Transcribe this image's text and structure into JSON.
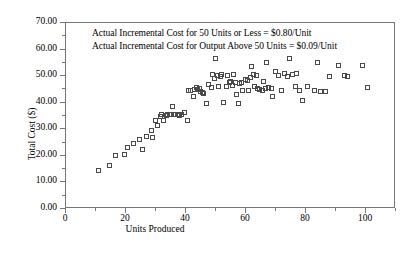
{
  "chart_data": {
    "type": "scatter",
    "title": "",
    "xlabel": "Units Produced",
    "ylabel": "Total Cost ($)",
    "xlim": [
      0,
      110
    ],
    "ylim": [
      0,
      70
    ],
    "grid": false,
    "legend": null,
    "marker": "open-square",
    "marker_color": "#4a4a4a",
    "xticks": [
      0,
      20,
      40,
      60,
      80,
      100
    ],
    "xtick_labels": [
      "0",
      "20",
      "40",
      "60",
      "80",
      "100"
    ],
    "xticks_minor": [
      10,
      30,
      50,
      70,
      90,
      110
    ],
    "yticks": [
      0,
      10,
      20,
      30,
      40,
      50,
      60,
      70
    ],
    "ytick_labels": [
      "0.00",
      "10.00",
      "20.00",
      "30.00",
      "40.00",
      "50.00",
      "60.00",
      "70.00"
    ],
    "yticks_minor": [
      5,
      15,
      25,
      35,
      45,
      55,
      65
    ],
    "annotations": [
      "Actual Incremental Cost for 50 Units or Less = $0.80/Unit",
      "Actual Incremental Cost for Output Above 50 Units = $0.09/Unit"
    ],
    "series": [
      {
        "name": "Total Cost observations",
        "points": [
          [
            11.0,
            14.2
          ],
          [
            14.5,
            16.3
          ],
          [
            16.5,
            20.0
          ],
          [
            19.5,
            20.2
          ],
          [
            20.5,
            22.8
          ],
          [
            22.5,
            24.5
          ],
          [
            24.5,
            25.8
          ],
          [
            25.5,
            22.3
          ],
          [
            27.0,
            27.0
          ],
          [
            28.5,
            29.5
          ],
          [
            29.0,
            26.8
          ],
          [
            30.0,
            33.3
          ],
          [
            30.5,
            31.2
          ],
          [
            31.5,
            34.5
          ],
          [
            32.0,
            35.3
          ],
          [
            32.5,
            33.0
          ],
          [
            33.5,
            35.0
          ],
          [
            34.0,
            35.2
          ],
          [
            34.5,
            35.4
          ],
          [
            35.0,
            35.5
          ],
          [
            35.5,
            38.5
          ],
          [
            36.0,
            35.2
          ],
          [
            36.5,
            35.3
          ],
          [
            37.5,
            35.4
          ],
          [
            38.0,
            35.0
          ],
          [
            38.5,
            35.2
          ],
          [
            39.5,
            36.0
          ],
          [
            40.5,
            33.3
          ],
          [
            41.0,
            44.5
          ],
          [
            41.5,
            44.3
          ],
          [
            42.5,
            42.0
          ],
          [
            43.0,
            44.8
          ],
          [
            43.5,
            45.5
          ],
          [
            44.0,
            44.6
          ],
          [
            44.5,
            45.0
          ],
          [
            45.0,
            44.2
          ],
          [
            45.5,
            43.5
          ],
          [
            46.0,
            43.3
          ],
          [
            47.0,
            39.7
          ],
          [
            47.5,
            46.8
          ],
          [
            48.5,
            45.5
          ],
          [
            49.0,
            50.3
          ],
          [
            49.5,
            48.8
          ],
          [
            50.0,
            56.5
          ],
          [
            50.5,
            50.0
          ],
          [
            51.0,
            46.0
          ],
          [
            51.5,
            49.8
          ],
          [
            52.0,
            50.3
          ],
          [
            52.5,
            39.8
          ],
          [
            53.5,
            45.8
          ],
          [
            54.0,
            50.2
          ],
          [
            54.5,
            47.5
          ],
          [
            55.0,
            47.8
          ],
          [
            55.5,
            46.3
          ],
          [
            56.0,
            50.5
          ],
          [
            56.5,
            47.5
          ],
          [
            57.0,
            43.0
          ],
          [
            57.5,
            39.5
          ],
          [
            58.0,
            47.0
          ],
          [
            58.5,
            47.3
          ],
          [
            59.0,
            44.3
          ],
          [
            60.0,
            48.5
          ],
          [
            60.5,
            48.0
          ],
          [
            61.0,
            44.3
          ],
          [
            61.5,
            49.3
          ],
          [
            62.0,
            53.5
          ],
          [
            62.5,
            50.3
          ],
          [
            63.0,
            46.0
          ],
          [
            63.5,
            50.0
          ],
          [
            64.0,
            45.0
          ],
          [
            64.5,
            44.7
          ],
          [
            65.5,
            44.5
          ],
          [
            66.0,
            47.8
          ],
          [
            66.5,
            45.2
          ],
          [
            67.0,
            54.8
          ],
          [
            67.5,
            45.5
          ],
          [
            68.5,
            45.3
          ],
          [
            69.0,
            42.0
          ],
          [
            70.0,
            51.5
          ],
          [
            71.0,
            50.0
          ],
          [
            72.0,
            44.5
          ],
          [
            73.0,
            50.8
          ],
          [
            74.0,
            49.5
          ],
          [
            74.5,
            56.5
          ],
          [
            75.5,
            50.3
          ],
          [
            76.5,
            46.0
          ],
          [
            77.0,
            50.8
          ],
          [
            78.0,
            44.5
          ],
          [
            79.0,
            40.8
          ],
          [
            80.5,
            46.0
          ],
          [
            83.0,
            44.3
          ],
          [
            84.0,
            55.0
          ],
          [
            85.0,
            44.0
          ],
          [
            86.5,
            44.0
          ],
          [
            88.0,
            49.5
          ],
          [
            91.0,
            54.0
          ],
          [
            93.0,
            50.0
          ],
          [
            94.0,
            49.5
          ],
          [
            99.0,
            54.0
          ],
          [
            100.5,
            45.5
          ]
        ]
      }
    ]
  }
}
